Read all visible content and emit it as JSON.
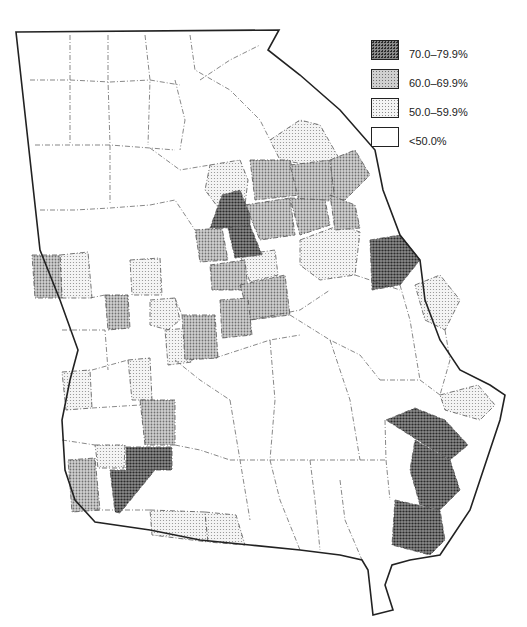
{
  "map": {
    "subject": "Georgia counties choropleth",
    "classes": [
      {
        "id": "c70",
        "label": "70.0–79.9%",
        "fill": "#5a5a5a",
        "pattern": "dense-dots"
      },
      {
        "id": "c60",
        "label": "60.0–69.9%",
        "fill": "#a6a6a6",
        "pattern": "medium-dots"
      },
      {
        "id": "c50",
        "label": "50.0–59.9%",
        "fill": "#dcdcdc",
        "pattern": "light-dots"
      },
      {
        "id": "c0",
        "label": "<50.0%",
        "fill": "#ffffff",
        "pattern": "none"
      }
    ]
  },
  "legend": {
    "items": [
      {
        "label": "70.0–79.9%"
      },
      {
        "label": "60.0–69.9%"
      },
      {
        "label": "50.0–59.9%"
      },
      {
        "label": "<50.0%"
      }
    ]
  }
}
